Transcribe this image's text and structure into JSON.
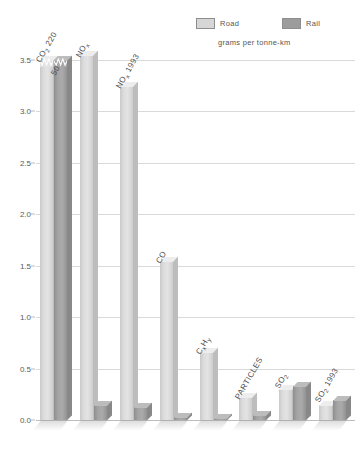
{
  "legend": {
    "items": [
      {
        "key": "road",
        "label": "Road",
        "color": "#d6d6d6"
      },
      {
        "key": "rail",
        "label": "Rail",
        "color": "#9c9c9c"
      }
    ],
    "unit_note": "grams per tonne-km"
  },
  "chart_data": {
    "type": "bar",
    "title": "",
    "subtitle": "",
    "xlabel": "",
    "ylabel": "grams per tonne-km",
    "ylim": [
      0.0,
      3.5
    ],
    "ytick_labels": [
      "0.0",
      "0.5",
      "1.0",
      "1.5",
      "2.0",
      "2.5",
      "3.0",
      "3.5"
    ],
    "ytick_values": [
      0.0,
      0.5,
      1.0,
      1.5,
      2.0,
      2.5,
      3.0,
      3.5
    ],
    "grid": true,
    "legend_position": "top-right",
    "axis_break": true,
    "axis_break_note": "CO2 bars are truncated with a zigzag break; their true values are printed in the category label",
    "categories": [
      "CO₂ 220",
      "NOₓ",
      "NOₓ 1993",
      "CO",
      "CₓHᵧ",
      "PARTICLES",
      "SO₂",
      "SO₂ 1993"
    ],
    "category_labels": [
      {
        "text": "CO2 220",
        "base": "CO",
        "sub": "2",
        "suffix": " 220"
      },
      {
        "text": "NOx",
        "base": "NO",
        "sub": "x",
        "suffix": ""
      },
      {
        "text": "NOx 1993",
        "base": "NO",
        "sub": "x",
        "suffix": " 1993"
      },
      {
        "text": "CO",
        "base": "CO",
        "sub": "",
        "suffix": ""
      },
      {
        "text": "CxHy",
        "base": "C",
        "sub": "x",
        "suffix": "H y"
      },
      {
        "text": "PARTICLES",
        "base": "PARTICLES",
        "sub": "",
        "suffix": ""
      },
      {
        "text": "SO2",
        "base": "SO",
        "sub": "2",
        "suffix": ""
      },
      {
        "text": "SO2 1993",
        "base": "SO",
        "sub": "2",
        "suffix": " 1993"
      }
    ],
    "extra_value_labels": [
      {
        "category": "CO₂ 220",
        "series": "Road",
        "label": "220"
      },
      {
        "category": "CO₂ 220",
        "series": "Rail",
        "label": "50"
      }
    ],
    "series": [
      {
        "name": "Road",
        "color": "#d6d6d6",
        "values": [
          220.0,
          3.55,
          3.25,
          1.55,
          0.66,
          0.22,
          0.3,
          0.15
        ],
        "plotted_heights": [
          3.5,
          3.55,
          3.25,
          1.55,
          0.66,
          0.22,
          0.3,
          0.15
        ]
      },
      {
        "name": "Rail",
        "color": "#9c9c9c",
        "values": [
          50.0,
          0.15,
          0.13,
          0.03,
          0.02,
          0.05,
          0.33,
          0.19
        ],
        "plotted_heights": [
          3.5,
          0.15,
          0.13,
          0.03,
          0.02,
          0.05,
          0.33,
          0.19
        ]
      }
    ]
  }
}
